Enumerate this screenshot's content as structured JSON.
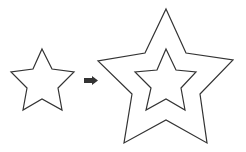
{
  "diagram": {
    "stroke_color": "#333333",
    "arrow_color": "#333333",
    "background": "#ffffff",
    "source_star": {
      "points": "42,49 52,69 74,72 58,88 62,110 42,99 23,110 27,88 11,72 33,69"
    },
    "arrow": {
      "direction": "right"
    },
    "result_outer_star": {
      "points": "166,9 186,53 233,60 200,94 207,143 166,120 124,143 132,94 98,61 145,53"
    },
    "result_inner_star": {
      "points": "166,49 176,70 196,72 181,88 185,110 166,99 146,110 151,88 135,72 157,70"
    }
  }
}
